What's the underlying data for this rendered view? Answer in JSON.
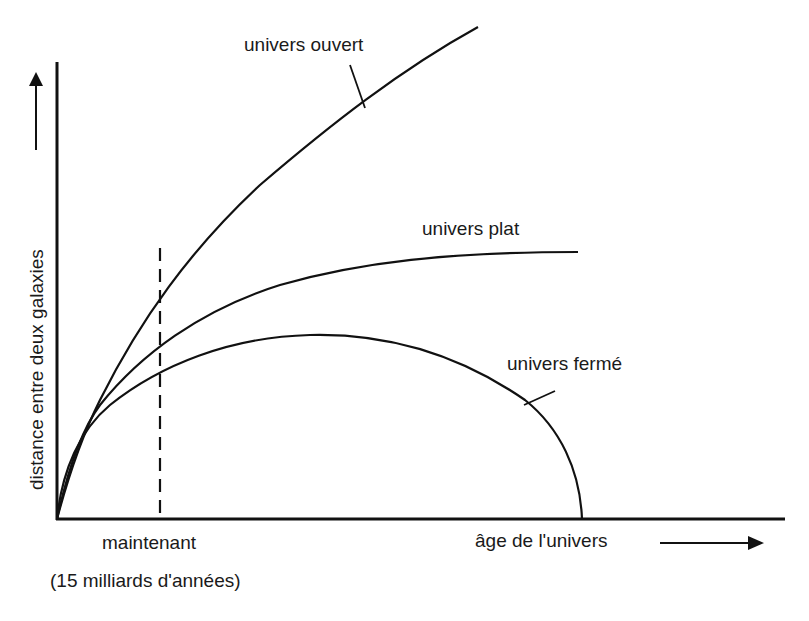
{
  "diagram": {
    "title": "",
    "y_axis_label": "distance entre deux galaxies",
    "x_axis_label": "âge de l'univers",
    "marker": {
      "label_line1": "maintenant",
      "label_line2": "(15 milliards d'années)"
    },
    "curves": [
      {
        "name": "univers ouvert",
        "description": "expansion continues indefinitely, increasing"
      },
      {
        "name": "univers plat",
        "description": "expansion slows, approaches asymptote"
      },
      {
        "name": "univers fermé",
        "description": "expands then recollapses to zero"
      }
    ],
    "colors": {
      "line": "#111111",
      "background": "#ffffff"
    }
  }
}
